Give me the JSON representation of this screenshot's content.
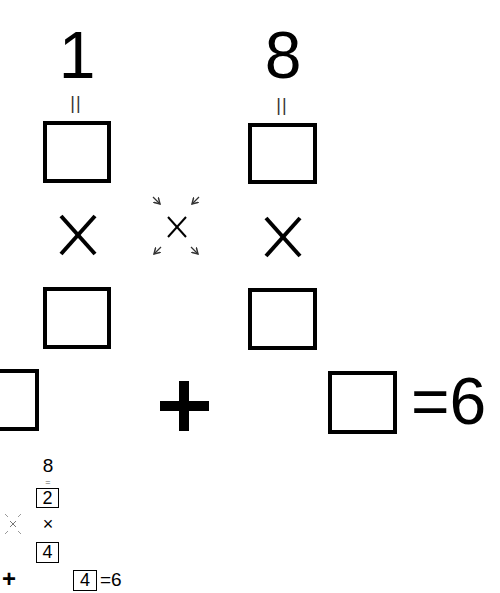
{
  "puzzle": {
    "top_numbers": [
      "1",
      "8"
    ],
    "equals_vertical": "||",
    "operator_multiply": "×",
    "operator_plus": "+",
    "result_label": "=6",
    "swap_hint": "cross-swap arrows"
  },
  "solution_preview": {
    "top_number": "8",
    "equals_vertical": "=",
    "box1_value": "2",
    "operator_multiply": "×",
    "box2_value": "4",
    "operator_plus": "+",
    "box3_value": "4",
    "result_label": "=6"
  },
  "colors": {
    "ink": "#000000",
    "background": "#ffffff",
    "arrow": "#333333"
  }
}
